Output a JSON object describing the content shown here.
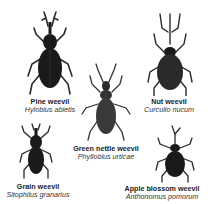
{
  "colors": {
    "body": "#1a1a1a",
    "body_light": "#3a3a3a",
    "legs": "#2a2a2a",
    "background": "#ffffff"
  },
  "weevils": [
    {
      "common_name": "Pine weevil",
      "latin_name": "Hylobius abietis"
    },
    {
      "common_name": "Nut weevil",
      "latin_name": "Curculio nucum"
    },
    {
      "common_name": "Green nettle weevil",
      "latin_name": "Phyllobius urticae"
    },
    {
      "common_name": "Grain weevil",
      "latin_name": "Sitophilus granarius"
    },
    {
      "common_name": "Apple blossom weevil",
      "latin_name": "Anthonomus pomorum"
    }
  ]
}
